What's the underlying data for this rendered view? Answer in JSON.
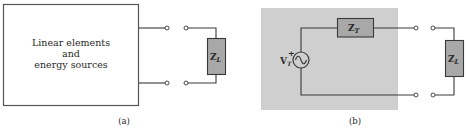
{
  "panel_a": {
    "block_text": [
      "Linear elements",
      "and",
      "energy sources"
    ],
    "load": {
      "symbol": "Z",
      "subscript": "L"
    },
    "caption": "(a)"
  },
  "panel_b": {
    "source": {
      "symbol": "V",
      "subscript": "T",
      "polarity": "+",
      "type": "ac-source"
    },
    "series_impedance": {
      "symbol": "Z",
      "subscript": "T"
    },
    "load": {
      "symbol": "Z",
      "subscript": "L"
    },
    "caption": "(b)"
  },
  "colors": {
    "line": "#3a3a3a",
    "resistor_fill": "#a8a8a8",
    "shaded_box": "#cfcfcf",
    "text": "#2a2a2a"
  }
}
